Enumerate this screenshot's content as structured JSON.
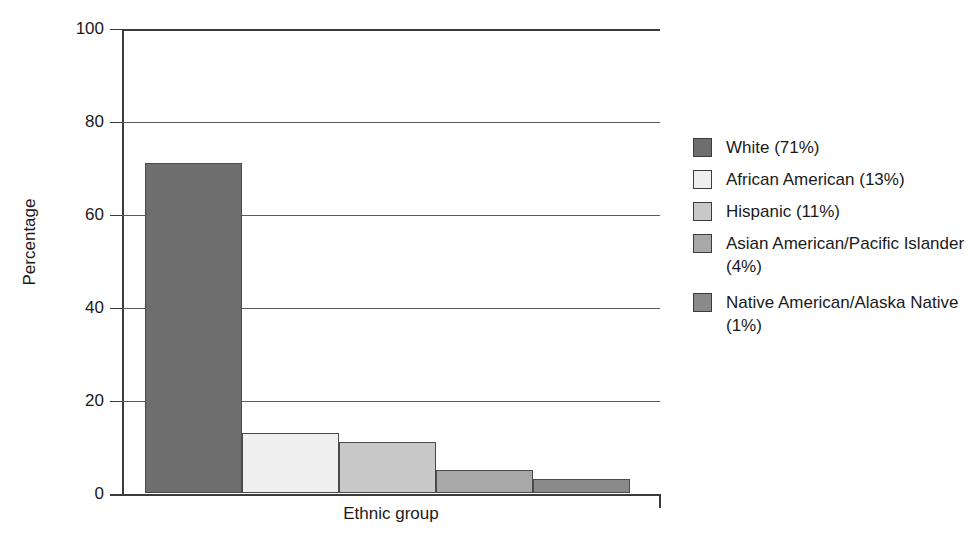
{
  "chart_data": {
    "type": "bar",
    "title": "",
    "xlabel": "Ethnic group",
    "ylabel": "Percentage",
    "categories": [
      "White",
      "African American",
      "Hispanic",
      "Asian American/Pacific Islander",
      "Native American/Alaska Native"
    ],
    "values": [
      71,
      13,
      11,
      5,
      3
    ],
    "legend_percentages": [
      "71%",
      "13%",
      "11%",
      "4%",
      "1%"
    ],
    "ylim": [
      0,
      100
    ],
    "yticks": [
      0,
      20,
      40,
      60,
      80,
      100
    ],
    "ytick_labels": [
      "0",
      "20",
      "40",
      "60",
      "80",
      "100"
    ],
    "grid": "horizontal",
    "legend_position": "right",
    "bar_colors": [
      "#6e6e6e",
      "#efefef",
      "#c8c8c8",
      "#a8a8a8",
      "#8a8a8a"
    ],
    "bar_edge_color": "#4a4a4a",
    "axis_color": "#3a3a3a",
    "gridline_color": "#5a5a5a",
    "background": "#ffffff"
  },
  "legend": {
    "items": [
      {
        "label": "White (71%)",
        "color": "#6e6e6e",
        "spaced": false
      },
      {
        "label": "African American (13%)",
        "color": "#efefef",
        "spaced": false
      },
      {
        "label": "Hispanic (11%)",
        "color": "#c8c8c8",
        "spaced": false
      },
      {
        "label": "Asian American/Pacific Islander (4%)",
        "color": "#a8a8a8",
        "spaced": false
      },
      {
        "label": "Native American/Alaska Native (1%)",
        "color": "#8a8a8a",
        "spaced": true
      }
    ]
  }
}
